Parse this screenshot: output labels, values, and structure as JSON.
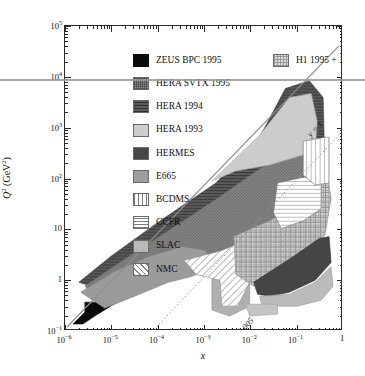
{
  "chart_data": {
    "type": "area",
    "title": "",
    "xlabel": "x",
    "ylabel": "Q² (GeV²)",
    "xscale": "log",
    "yscale": "log",
    "xlim": [
      1e-06,
      1
    ],
    "ylim": [
      0.1,
      100000
    ],
    "grid": false,
    "legend_position": "top-left inside plot",
    "x_tick_labels": [
      "10−6",
      "10−5",
      "10−4",
      "10−3",
      "10−2",
      "10−1",
      "1"
    ],
    "x_tick_values": [
      1e-06,
      1e-05,
      0.0001,
      0.001,
      0.01,
      0.1,
      1
    ],
    "y_tick_labels": [
      "10−1",
      "1",
      "10",
      "10²",
      "10³",
      "10⁴",
      "10⁵"
    ],
    "y_tick_values": [
      0.1,
      1,
      10,
      100,
      1000,
      10000,
      100000
    ],
    "annotations": [
      {
        "text": "y = 1",
        "kind": "diagonal-line-label",
        "line": "solid",
        "slope": "Q² = s·x"
      },
      {
        "text": "y = 0.005",
        "kind": "diagonal-line-label",
        "line": "dotted",
        "slope": "Q² = 0.005·s·x"
      }
    ],
    "series": [
      {
        "name": "ZEUS BPC 1995",
        "swatch": "sw-zeusbpc",
        "fill": "#0a0a0a",
        "pattern": "solid",
        "x_range": [
          4e-06,
          0.0006
        ],
        "q2_range": [
          0.1,
          1.0
        ]
      },
      {
        "name": "HERA SVTX 1995",
        "swatch": "sw-heravtx",
        "fill": "#8c8c8c",
        "pattern": "fine-checker",
        "x_range": [
          3e-05,
          0.5
        ],
        "q2_range": [
          0.6,
          120
        ]
      },
      {
        "name": "HERA 1994",
        "swatch": "sw-hera94",
        "fill": "#5b5b5b",
        "pattern": "horizontal-dense",
        "x_range": [
          3e-05,
          0.7
        ],
        "q2_range": [
          1.5,
          5000
        ]
      },
      {
        "name": "HERA 1993",
        "swatch": "sw-hera93",
        "fill": "#cdcdcd",
        "pattern": "solid",
        "x_range": [
          0.0002,
          0.5
        ],
        "q2_range": [
          4,
          2000
        ]
      },
      {
        "name": "HERMES",
        "swatch": "sw-hermes",
        "fill": "#474747",
        "pattern": "solid",
        "x_range": [
          0.02,
          0.85
        ],
        "q2_range": [
          0.8,
          12
        ]
      },
      {
        "name": "E665",
        "swatch": "sw-e665",
        "fill": "#9e9e9e",
        "pattern": "solid",
        "x_range": [
          0.0008,
          0.3
        ],
        "q2_range": [
          0.25,
          70
        ]
      },
      {
        "name": "BCDMS",
        "swatch": "sw-bcdms",
        "fill": "#ffffff",
        "pattern": "vertical-lines",
        "x_range": [
          0.06,
          0.8
        ],
        "q2_range": [
          7,
          260
        ]
      },
      {
        "name": "CCFR",
        "swatch": "sw-ccfr",
        "fill": "#ffffff",
        "pattern": "horizontal-lines",
        "x_range": [
          0.01,
          0.7
        ],
        "q2_range": [
          1.2,
          200
        ]
      },
      {
        "name": "SLAC",
        "swatch": "sw-slac",
        "fill": "#b9b9b9",
        "pattern": "solid",
        "x_range": [
          0.06,
          0.9
        ],
        "q2_range": [
          0.6,
          30
        ]
      },
      {
        "name": "NMC",
        "swatch": "sw-nmc",
        "fill": "#ffffff",
        "pattern": "diagonal-hatch",
        "x_range": [
          0.006,
          0.6
        ],
        "q2_range": [
          0.5,
          70
        ]
      },
      {
        "name": "H1 1995 + 1996",
        "swatch": "sw-h1",
        "fill": "#dcdcdc",
        "pattern": "coarse-checker",
        "x_range": [
          0.006,
          0.9
        ],
        "q2_range": [
          1.5,
          300
        ]
      }
    ]
  },
  "axes": {
    "y_title_main": "Q",
    "y_title_sup": "2",
    "y_title_unit": " (GeV",
    "y_title_unit_sup": "2",
    "y_title_unit_end": ")",
    "x_title": "x"
  },
  "y_ticks": [
    {
      "mantissa": "10",
      "exp": "5"
    },
    {
      "mantissa": "10",
      "exp": "4"
    },
    {
      "mantissa": "10",
      "exp": "3"
    },
    {
      "mantissa": "10",
      "exp": "2"
    },
    {
      "mantissa": "10",
      "exp": ""
    },
    {
      "mantissa": "1",
      "exp": ""
    },
    {
      "mantissa": "10",
      "exp": "−1"
    }
  ],
  "x_ticks": [
    {
      "mantissa": "10",
      "exp": "−6"
    },
    {
      "mantissa": "10",
      "exp": "−5"
    },
    {
      "mantissa": "10",
      "exp": "−4"
    },
    {
      "mantissa": "10",
      "exp": "−3"
    },
    {
      "mantissa": "10",
      "exp": "−2"
    },
    {
      "mantissa": "10",
      "exp": "−1"
    },
    {
      "mantissa": "1",
      "exp": ""
    }
  ],
  "legend": {
    "column1": [
      {
        "label": "ZEUS BPC 1995",
        "swatch": "sw-zeusbpc"
      },
      {
        "label": "HERA SVTX 1995",
        "swatch": "sw-heravtx"
      },
      {
        "label": "HERA 1994",
        "swatch": "sw-hera94"
      },
      {
        "label": "HERA 1993",
        "swatch": "sw-hera93"
      },
      {
        "label": "HERMES",
        "swatch": "sw-hermes"
      },
      {
        "label": "E665",
        "swatch": "sw-e665"
      },
      {
        "label": "BCDMS",
        "swatch": "sw-bcdms"
      },
      {
        "label": "CCFR",
        "swatch": "sw-ccfr"
      },
      {
        "label": "SLAC",
        "swatch": "sw-slac"
      },
      {
        "label": "NMC",
        "swatch": "sw-nmc"
      }
    ],
    "column2": [
      {
        "label": "H1 1995 + 1996",
        "swatch": "sw-h1"
      }
    ]
  },
  "annotations": {
    "y_equals_one": "y = 1",
    "y_equals_0005": "y = 0.005"
  },
  "colors": {
    "axis": "#2b2b2b",
    "background": "#ffffff",
    "artifact_line": "#9a9a9a"
  }
}
